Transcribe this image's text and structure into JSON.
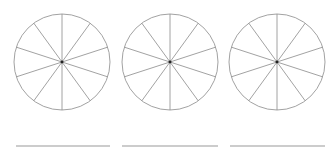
{
  "diagram": {
    "stroke_color": "#8a8a8a",
    "center_dot_color": "#222222",
    "line_color": "#9a9a9a",
    "circles": [
      {
        "id": "circle-1",
        "cx": 62,
        "cy": 62,
        "r": 48,
        "sectors": 10
      },
      {
        "id": "circle-2",
        "cx": 170,
        "cy": 62,
        "r": 48,
        "sectors": 10
      },
      {
        "id": "circle-3",
        "cx": 277,
        "cy": 62,
        "r": 48,
        "sectors": 10
      }
    ],
    "answer_lines": [
      {
        "id": "answer-line-1",
        "x1": 16,
        "x2": 110,
        "y": 146
      },
      {
        "id": "answer-line-2",
        "x1": 122,
        "x2": 218,
        "y": 146
      },
      {
        "id": "answer-line-3",
        "x1": 230,
        "x2": 325,
        "y": 146
      }
    ]
  }
}
